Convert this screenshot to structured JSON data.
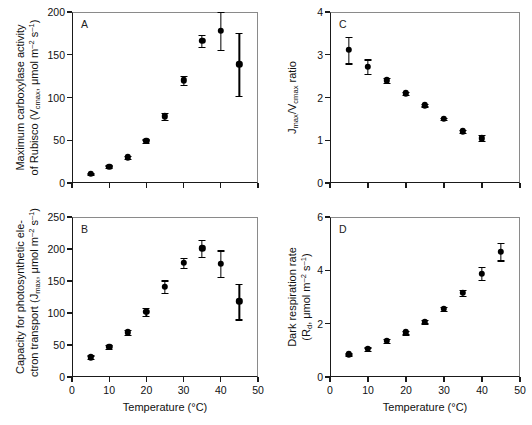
{
  "figure": {
    "width": 532,
    "height": 425,
    "background": "#ffffff",
    "marker_color": "#000000",
    "axis_color": "#1a1a1a"
  },
  "axis_titles": {
    "x_shared": "Temperature (°C)",
    "x_unit": "°C",
    "x_name": "Temperature"
  },
  "panels": [
    {
      "letter": "A",
      "y_title_line1": "Maximum carboxylase activity",
      "y_title_line2": "of Rubisco (V<sub>cmax</sub>, μmol m<sup>–2</sup> s<sup>–1</sup>)",
      "y_ticks": [
        0,
        50,
        100,
        150,
        200
      ],
      "x_ticks": [
        0,
        10,
        20,
        30,
        40,
        50
      ],
      "x_ticklabels_shown": false
    },
    {
      "letter": "B",
      "y_title_line1": "Capacity for photosynthetic ele-",
      "y_title_line2": "ctron transport (J<sub>max</sub>, μmol m<sup>–2</sup> s<sup>–1</sup>)",
      "y_ticks": [
        0,
        50,
        100,
        150,
        200,
        250
      ],
      "x_ticks": [
        0,
        10,
        20,
        30,
        40,
        50
      ],
      "x_ticklabels_shown": true
    },
    {
      "letter": "C",
      "y_title_line1": "J<sub>max</sub>/V<sub>cmax</sub> ratio",
      "y_title_line2": "",
      "y_ticks": [
        0,
        1,
        2,
        3,
        4
      ],
      "x_ticks": [
        0,
        10,
        20,
        30,
        40,
        50
      ],
      "x_ticklabels_shown": false
    },
    {
      "letter": "D",
      "y_title_line1": "Dark respiration rate",
      "y_title_line2": "(R<sub>d</sub>, μmol m<sup>–2</sup> s<sup>–1</sup>)",
      "y_ticks": [
        0,
        2,
        4,
        6
      ],
      "x_ticks": [
        0,
        10,
        20,
        30,
        40,
        50
      ],
      "x_ticklabels_shown": true
    }
  ],
  "chart_data": [
    {
      "id": "A",
      "type": "scatter",
      "title": "Maximum carboxylase activity of Rubisco",
      "xlabel": "Temperature (°C)",
      "ylabel": "Vcmax (μmol m-2 s-1)",
      "xlim": [
        0,
        50
      ],
      "ylim": [
        0,
        200
      ],
      "xticks": [
        0,
        10,
        20,
        30,
        40,
        50
      ],
      "yticks": [
        0,
        50,
        100,
        150,
        200
      ],
      "grid": false,
      "legend": "none",
      "x": [
        5,
        10,
        15,
        20,
        25,
        30,
        35,
        40,
        45
      ],
      "values": [
        11,
        19,
        30,
        49,
        78,
        120,
        166,
        178,
        139
      ],
      "error": [
        1,
        1.5,
        2,
        2,
        4,
        5,
        7,
        22,
        37
      ]
    },
    {
      "id": "B",
      "type": "scatter",
      "title": "Capacity for photosynthetic electron transport",
      "xlabel": "Temperature (°C)",
      "ylabel": "Jmax (μmol m-2 s-1)",
      "xlim": [
        0,
        50
      ],
      "ylim": [
        0,
        250
      ],
      "xticks": [
        0,
        10,
        20,
        30,
        40,
        50
      ],
      "yticks": [
        0,
        50,
        100,
        150,
        200,
        250
      ],
      "grid": false,
      "legend": "none",
      "x": [
        5,
        10,
        15,
        20,
        25,
        30,
        35,
        40,
        45
      ],
      "values": [
        31,
        47,
        70,
        102,
        141,
        178,
        201,
        177,
        118
      ],
      "error": [
        3,
        3,
        4,
        6,
        10,
        8,
        13,
        21,
        28
      ]
    },
    {
      "id": "C",
      "type": "scatter",
      "title": "Jmax / Vcmax ratio",
      "xlabel": "Temperature (°C)",
      "ylabel": "Jmax/Vcmax ratio",
      "xlim": [
        0,
        50
      ],
      "ylim": [
        0,
        4
      ],
      "xticks": [
        0,
        10,
        20,
        30,
        40,
        50
      ],
      "yticks": [
        0,
        1,
        2,
        3,
        4
      ],
      "grid": false,
      "legend": "none",
      "x": [
        5,
        10,
        15,
        20,
        25,
        30,
        35,
        40,
        45
      ],
      "values": [
        3.11,
        2.72,
        2.4,
        2.1,
        1.82,
        1.5,
        1.21,
        1.05,
        null
      ],
      "error": [
        0.31,
        0.17,
        0.06,
        0.04,
        0.03,
        0.03,
        0.03,
        0.07,
        null
      ]
    },
    {
      "id": "D",
      "type": "scatter",
      "title": "Dark respiration rate",
      "xlabel": "Temperature (°C)",
      "ylabel": "Rd (μmol m-2 s-1)",
      "xlim": [
        0,
        50
      ],
      "ylim": [
        0,
        6
      ],
      "xticks": [
        0,
        10,
        20,
        30,
        40,
        50
      ],
      "yticks": [
        0,
        2,
        4,
        6
      ],
      "grid": false,
      "legend": "none",
      "x": [
        5,
        10,
        15,
        20,
        25,
        30,
        35,
        40,
        45
      ],
      "values": [
        0.85,
        1.05,
        1.35,
        1.67,
        2.08,
        2.56,
        3.15,
        3.88,
        4.7
      ],
      "error": [
        0.04,
        0.06,
        0.08,
        0.07,
        0.07,
        0.07,
        0.12,
        0.25,
        0.33
      ]
    }
  ]
}
